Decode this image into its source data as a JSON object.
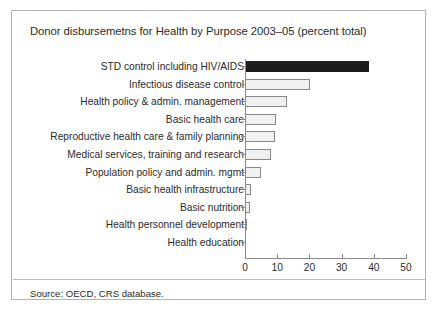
{
  "figure": {
    "title": "Donor disbursemetns for Health by Purpose 2003–05 (percent total)",
    "source": "Source: OECD, CRS database.",
    "border_color": "#b4b4b4",
    "background": "#ffffff"
  },
  "chart_data": {
    "type": "bar",
    "orientation": "horizontal",
    "title": "Donor disbursemetns for Health by Purpose 2003–05 (percent total)",
    "xlabel": "",
    "ylabel": "",
    "xlim": [
      0,
      50
    ],
    "grid": false,
    "legend": null,
    "xticks": [
      0,
      10,
      20,
      30,
      40,
      50
    ],
    "xtick_labels": [
      "0",
      "10",
      "20",
      "30",
      "40",
      "50"
    ],
    "categories": [
      "STD control including HIV/AIDS",
      "Infectious disease control",
      "Health policy & admin. management",
      "Basic health care",
      "Reproductive health care & family planning",
      "Medical services, training and research",
      "Population policy and admin. mgmt",
      "Basic health infrastructure",
      "Basic nutrition",
      "Health personnel development",
      "Health education"
    ],
    "values": [
      38.5,
      20.2,
      13.0,
      9.6,
      9.4,
      8.0,
      5.0,
      1.9,
      1.4,
      0.2,
      0.1
    ],
    "highlight_index": 0,
    "highlight_color": "#1c1c1c",
    "bar_color": "#f0f0f0",
    "bar_edge_color": "#888888"
  }
}
